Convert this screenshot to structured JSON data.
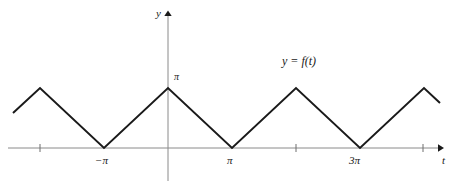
{
  "figure": {
    "title": "",
    "background_color": "#ffffff",
    "axis_color": "#8a8a8a",
    "curve_color": "#1a1a1a",
    "text_color": "#1a1a1a"
  },
  "labels": {
    "y_axis": "y",
    "t_axis": "t",
    "y_peak_value": "π",
    "tick_neg_pi": "−π",
    "tick_pi": "π",
    "tick_3pi": "3π",
    "function_label": "y = f(t)"
  },
  "chart_data": {
    "type": "line",
    "title": "",
    "xlabel": "t",
    "ylabel": "y",
    "grid": false,
    "legend": null,
    "annotations": [
      {
        "text": "y = f(t)",
        "x": 2.6,
        "y": 2.45
      },
      {
        "text": "π",
        "x": 0.12,
        "y": 3.14159
      }
    ],
    "xlim": [
      -3.35,
      4.35
    ],
    "ylim": [
      -0.5,
      4.0
    ],
    "x_tick_labels": [
      "−π",
      "π",
      "3π"
    ],
    "x_tick_label_positions": [
      -1,
      1,
      3
    ],
    "x_unlabeled_ticks": [
      -2,
      2,
      4
    ],
    "y_tick_labels": [
      "π"
    ],
    "y_tick_label_positions": [
      3.14159
    ],
    "series": [
      {
        "name": "f(t)",
        "x": [
          -2.42,
          -2.0,
          -1.0,
          0.0,
          1.0,
          2.0,
          3.0,
          4.0,
          4.26
        ],
        "y": [
          2.0,
          3.14159,
          0.0,
          3.14159,
          0.0,
          3.14159,
          0.0,
          3.14159,
          2.3
        ],
        "color": "#1a1a1a",
        "width": 2
      }
    ],
    "pixel_geometry": {
      "note": "Polyline vertices in screenshot pixel coordinates",
      "x_axis_y": 148,
      "y_axis_x": 168,
      "peak_y": 88,
      "points": [
        [
          13,
          113
        ],
        [
          40,
          88
        ],
        [
          104,
          148
        ],
        [
          168,
          88
        ],
        [
          232,
          148
        ],
        [
          296,
          88
        ],
        [
          360,
          148
        ],
        [
          424,
          88
        ],
        [
          440,
          103
        ]
      ],
      "x_axis_extent": [
        8,
        441
      ],
      "y_axis_extent": [
        12,
        181
      ],
      "tick_x_positions": [
        40,
        296,
        423
      ],
      "valley_x_positions": [
        104,
        232,
        360
      ]
    }
  }
}
